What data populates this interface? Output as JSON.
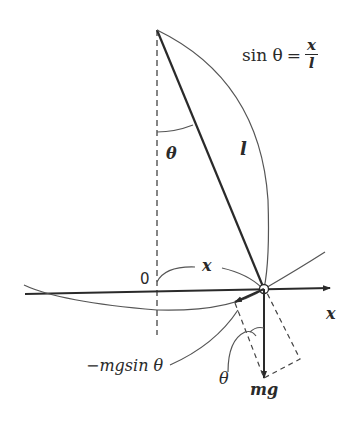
{
  "diagram": {
    "type": "simple-pendulum-force-diagram",
    "formula": {
      "lhs": "sin θ",
      "equals": "=",
      "numerator": "x",
      "denominator": "l"
    },
    "labels": {
      "angle_at_pivot": "θ",
      "string_length": "l",
      "origin": "0",
      "arc_displacement": "x",
      "axis": "x",
      "restoring_force": "−mgsin θ",
      "angle_at_bob": "θ",
      "weight": "mg"
    },
    "colors": {
      "line": "#2a2a2a",
      "thin_line": "#555555",
      "background": "#ffffff"
    }
  }
}
